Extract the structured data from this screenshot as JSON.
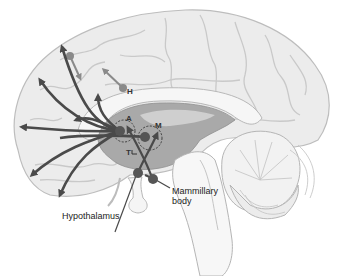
{
  "diagram": {
    "colors": {
      "cortex": "#ececec",
      "cortex_outline": "#bdbdbd",
      "sulci": "#c9c9c9",
      "ventricle_region": "#a9a9a9",
      "corpus_callosum": "#f4f4f4",
      "arrows": "#4a4a4a",
      "nuclei": "#555555",
      "background": "#ffffff"
    },
    "labels": {
      "h": "H",
      "a": "A",
      "m": "M",
      "t": "T",
      "hypothalamus": "Hypothalamus",
      "mammillary_line1": "Mammillary",
      "mammillary_line2": "body"
    }
  }
}
